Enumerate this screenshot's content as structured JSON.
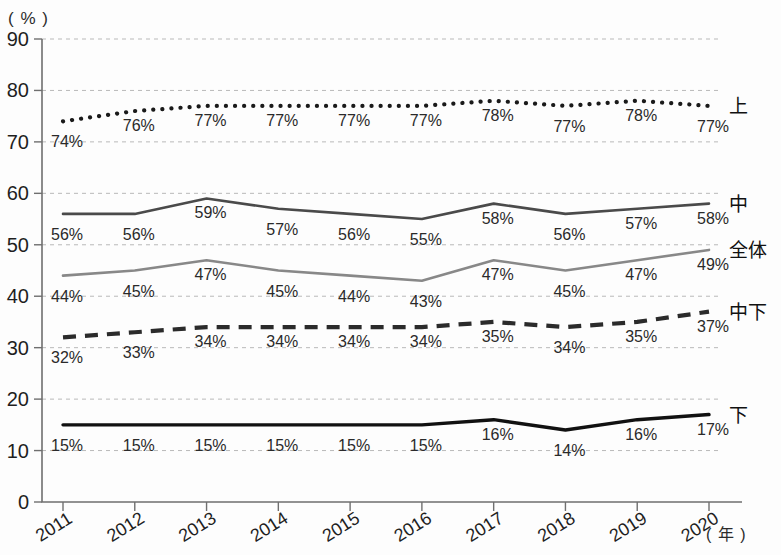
{
  "chart_data": {
    "type": "line",
    "title": "",
    "xlabel": "( 年 )",
    "ylabel": "( % )",
    "categories": [
      "2011",
      "2012",
      "2013",
      "2014",
      "2015",
      "2016",
      "2017",
      "2018",
      "2019",
      "2020"
    ],
    "ylim": [
      0,
      90
    ],
    "ytick_labels": [
      "0",
      "10",
      "20",
      "30",
      "40",
      "50",
      "60",
      "70",
      "80",
      "90"
    ],
    "yticks": [
      0,
      10,
      20,
      30,
      40,
      50,
      60,
      70,
      80,
      90
    ],
    "grid": true,
    "legend_position": "right-of-line-ends",
    "series": [
      {
        "name": "上",
        "style": "dotted",
        "color": "#1a1a1a",
        "values": [
          74,
          76,
          77,
          77,
          77,
          77,
          78,
          77,
          78,
          77
        ],
        "labels": [
          "74%",
          "76%",
          "77%",
          "77%",
          "77%",
          "77%",
          "78%",
          "77%",
          "78%",
          "77%"
        ]
      },
      {
        "name": "中",
        "style": "solid",
        "color": "#4a4a4a",
        "values": [
          56,
          56,
          59,
          57,
          56,
          55,
          58,
          56,
          57,
          58
        ],
        "labels": [
          "56%",
          "56%",
          "59%",
          "57%",
          "56%",
          "55%",
          "58%",
          "56%",
          "57%",
          "58%"
        ]
      },
      {
        "name": "全体",
        "style": "solid",
        "color": "#888888",
        "values": [
          44,
          45,
          47,
          45,
          44,
          43,
          47,
          45,
          47,
          49
        ],
        "labels": [
          "44%",
          "45%",
          "47%",
          "45%",
          "44%",
          "43%",
          "47%",
          "45%",
          "47%",
          "49%"
        ]
      },
      {
        "name": "中下",
        "style": "dashed",
        "color": "#2b2b2b",
        "values": [
          32,
          33,
          34,
          34,
          34,
          34,
          35,
          34,
          35,
          37
        ],
        "labels": [
          "32%",
          "33%",
          "34%",
          "34%",
          "34%",
          "34%",
          "35%",
          "34%",
          "35%",
          "37%"
        ]
      },
      {
        "name": "下",
        "style": "solid",
        "color": "#111111",
        "values": [
          15,
          15,
          15,
          15,
          15,
          15,
          16,
          14,
          16,
          17
        ],
        "labels": [
          "15%",
          "15%",
          "15%",
          "15%",
          "15%",
          "15%",
          "16%",
          "14%",
          "16%",
          "17%"
        ]
      }
    ]
  }
}
